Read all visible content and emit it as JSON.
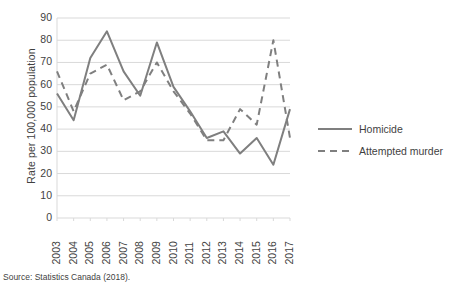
{
  "chart_data": {
    "type": "line",
    "title": "",
    "xlabel": "",
    "ylabel": "Rate per 100,000 population",
    "ylim": [
      0,
      90
    ],
    "ytick_step": 10,
    "yticks": [
      90,
      80,
      70,
      60,
      50,
      40,
      30,
      20,
      10,
      0
    ],
    "grid": true,
    "legend_position": "right",
    "categories": [
      "2003",
      "2004",
      "2005",
      "2006",
      "2007",
      "2008",
      "2009",
      "2010",
      "2011",
      "2012",
      "2013",
      "2014",
      "2015",
      "2016",
      "2017"
    ],
    "series": [
      {
        "name": "Homicide",
        "style": "solid",
        "color": "#7f7f7f",
        "values": [
          56,
          44,
          72,
          84,
          66,
          55,
          79,
          59,
          48,
          36,
          39,
          29,
          36,
          24,
          49
        ]
      },
      {
        "name": "Attempted murder",
        "style": "dashed",
        "color": "#7f7f7f",
        "values": [
          66,
          48,
          65,
          69,
          53,
          57,
          70,
          57,
          47,
          35,
          35,
          49,
          42,
          80,
          36
        ]
      }
    ]
  },
  "axis": {
    "y_title": "Rate per 100,000 population",
    "y_tick_labels": [
      "90",
      "80",
      "70",
      "60",
      "50",
      "40",
      "30",
      "20",
      "10",
      "0"
    ],
    "x_tick_labels": [
      "2003",
      "2004",
      "2005",
      "2006",
      "2007",
      "2008",
      "2009",
      "2010",
      "2011",
      "2012",
      "2013",
      "2014",
      "2015",
      "2016",
      "2017"
    ]
  },
  "legend": {
    "items": [
      {
        "label": "Homicide",
        "style": "solid"
      },
      {
        "label": "Attempted murder",
        "style": "dashed"
      }
    ]
  },
  "source": {
    "text": "Source: Statistics Canada (2018)."
  },
  "colors": {
    "line": "#7f7f7f",
    "grid": "#d9d9d9",
    "text": "#3f3f3f",
    "background": "#ffffff"
  }
}
